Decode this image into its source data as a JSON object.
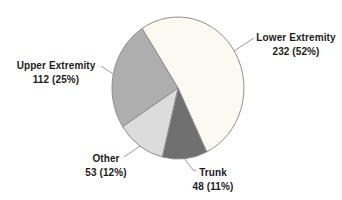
{
  "figure": {
    "background_color": "#ffffff",
    "outline_color": "#8f8f8f",
    "leader_line_color": "#9a9a9a",
    "labels": [
      {
        "id": "lower-extremity",
        "name": "Lower Extremity",
        "stat": "232 (52%)"
      },
      {
        "id": "upper-extremity",
        "name": "Upper Extremity",
        "stat": "112 (25%)"
      },
      {
        "id": "other",
        "name": "Other",
        "stat": "53 (12%)"
      },
      {
        "id": "trunk",
        "name": "Trunk",
        "stat": "48 (11%)"
      }
    ]
  },
  "chart_data": {
    "type": "pie",
    "title": "",
    "categories": [
      "Lower Extremity",
      "Trunk",
      "Other",
      "Upper Extremity"
    ],
    "values": [
      232,
      48,
      53,
      112
    ],
    "percentages": [
      52,
      11,
      12,
      25
    ],
    "colors": [
      "#fbfaf0",
      "#6f6f6f",
      "#dcdcdc",
      "#aeaeae"
    ],
    "total": 445,
    "start_angle_deg_from_top": -33,
    "direction": "clockwise",
    "legend_position": "none",
    "data_labels": "outside-with-leader-lines",
    "label_format": "name newline value (percent%)"
  }
}
